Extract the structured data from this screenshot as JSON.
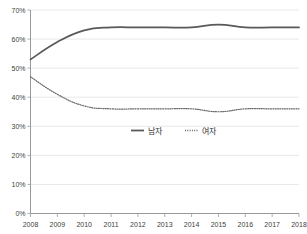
{
  "chart_data": {
    "type": "line",
    "title": "",
    "subtitle": "",
    "xlabel": "",
    "ylabel": "",
    "x": [
      2008,
      2009,
      2010,
      2011,
      2012,
      2013,
      2014,
      2015,
      2016,
      2017,
      2018
    ],
    "categories": [
      "2008",
      "2009",
      "2010",
      "2011",
      "2012",
      "2013",
      "2014",
      "2015",
      "2016",
      "2017",
      "2018"
    ],
    "series": [
      {
        "name": "남자",
        "style": "solid",
        "color": "#595959",
        "values": [
          53,
          59,
          63,
          64,
          64,
          64,
          64,
          65,
          64,
          64,
          64
        ]
      },
      {
        "name": "여자",
        "style": "dotted",
        "color": "#666666",
        "values": [
          47,
          41,
          37,
          36,
          36,
          36,
          36,
          35,
          36,
          36,
          36
        ]
      }
    ],
    "ylim": [
      0,
      70
    ],
    "ytick_values": [
      0,
      10,
      20,
      30,
      40,
      50,
      60,
      70
    ],
    "ytick_labels": [
      "0%",
      "10%",
      "20%",
      "30%",
      "40%",
      "50%",
      "60%",
      "70%"
    ],
    "xlim": [
      2008,
      2018
    ],
    "xtick_labels": [
      "2008",
      "2009",
      "2010",
      "2011",
      "2012",
      "2013",
      "2014",
      "2015",
      "2016",
      "2017",
      "2018"
    ],
    "grid": true,
    "grid_axis": "y",
    "legend_position": "center",
    "value_suffix": "%"
  },
  "legend": {
    "entries": [
      {
        "label": "남자",
        "marker": "solid-line-swatch"
      },
      {
        "label": "여자",
        "marker": "dotted-line-swatch"
      }
    ]
  },
  "colors": {
    "male_line": "#595959",
    "female_line": "#666666",
    "gridline": "#e2e2e2",
    "axis": "#9a9a9a",
    "tick_text": "#404040",
    "legend_text": "#333333",
    "background": "#ffffff"
  }
}
